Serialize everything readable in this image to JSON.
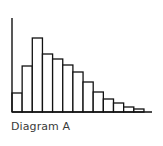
{
  "caption": "Diagram A",
  "chart_data": {
    "type": "bar",
    "title": "",
    "caption": "Diagram A",
    "xlabel": "",
    "ylabel": "",
    "categories": [
      "1",
      "2",
      "3",
      "4",
      "5",
      "6",
      "7",
      "8",
      "9",
      "10",
      "11",
      "12",
      "13"
    ],
    "values": [
      19,
      46,
      74,
      58,
      53,
      47,
      40,
      30,
      20,
      13,
      9,
      5,
      3
    ],
    "ylim": [
      0,
      94
    ],
    "grid": false,
    "legend": null,
    "tick_labels": false,
    "colors": {
      "bar_fill": "#ffffff",
      "bar_stroke": "#111111",
      "axis": "#111111",
      "caption": "#3a3a3a"
    }
  }
}
